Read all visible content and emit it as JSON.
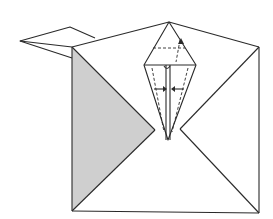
{
  "diagram": {
    "type": "origami-fold-step",
    "colors": {
      "background": "#ffffff",
      "stroke": "#2a2a2a",
      "shading": "#cfcfcf"
    },
    "elements": [
      {
        "name": "square-base",
        "description": "paper square with diagonal creases"
      },
      {
        "name": "shaded-triangle",
        "description": "left triangle shaded (reverse side of paper)"
      },
      {
        "name": "left-flap",
        "description": "small folded flap protruding at top-left"
      },
      {
        "name": "kite-fold",
        "description": "central kite/diamond fold with dashed crease"
      },
      {
        "name": "fold-arrows",
        "description": "arrows indicating inward folds on kite"
      }
    ]
  }
}
